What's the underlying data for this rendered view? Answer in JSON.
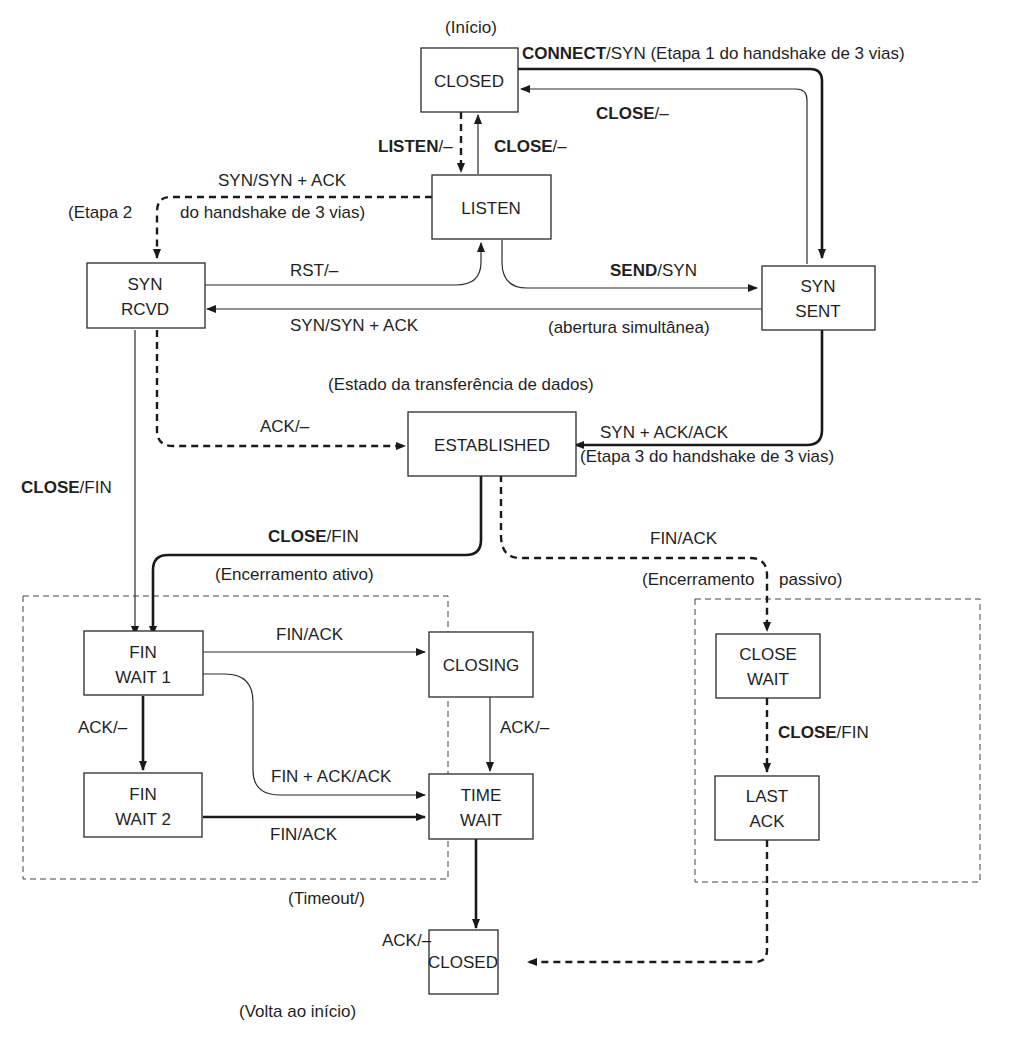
{
  "figure": {
    "states": {
      "closed_top": {
        "lines": [
          "CLOSED"
        ],
        "caption": "(Início)"
      },
      "listen": {
        "lines": [
          "LISTEN"
        ]
      },
      "syn_rcvd": {
        "lines": [
          "SYN",
          "RCVD"
        ]
      },
      "syn_sent": {
        "lines": [
          "SYN",
          "SENT"
        ]
      },
      "established": {
        "lines": [
          "ESTABLISHED"
        ],
        "caption": "(Estado da transferência de dados)"
      },
      "fin_wait_1": {
        "lines": [
          "FIN",
          "WAIT 1"
        ]
      },
      "fin_wait_2": {
        "lines": [
          "FIN",
          "WAIT 2"
        ]
      },
      "closing": {
        "lines": [
          "CLOSING"
        ]
      },
      "time_wait": {
        "lines": [
          "TIME",
          "WAIT"
        ]
      },
      "close_wait": {
        "lines": [
          "CLOSE",
          "WAIT"
        ]
      },
      "last_ack": {
        "lines": [
          "LAST",
          "ACK"
        ]
      },
      "closed_bottom": {
        "lines": [
          "CLOSED"
        ],
        "caption": "(Volta ao início)"
      }
    },
    "transitions": {
      "connect": {
        "bold": "CONNECT",
        "rest": "/SYN (Etapa 1 do handshake de 3 vias)"
      },
      "close_syn_sent": {
        "bold": "CLOSE",
        "rest": "/–"
      },
      "listen_from_closed": {
        "bold": "LISTEN",
        "rest": "/–"
      },
      "close_listen": {
        "bold": "CLOSE",
        "rest": "/–"
      },
      "syn_synack": {
        "text": "SYN/SYN + ACK"
      },
      "etapa2_a": {
        "text": "(Etapa 2"
      },
      "etapa2_b": {
        "text": "do handshake de 3 vias)"
      },
      "rst": {
        "text": "RST/–"
      },
      "send": {
        "bold": "SEND",
        "rest": "/SYN"
      },
      "syn_synack_simul": {
        "text": "SYN/SYN + ACK"
      },
      "simultaneous_open": {
        "text": "(abertura simultânea)"
      },
      "ack_established": {
        "text": "ACK/–"
      },
      "synack_ack": {
        "text": "SYN + ACK/ACK"
      },
      "etapa3": {
        "text": "(Etapa 3 do handshake de 3 vias)"
      },
      "close_fin_left": {
        "bold": "CLOSE",
        "rest": "/FIN"
      },
      "close_fin_est": {
        "bold": "CLOSE",
        "rest": "/FIN"
      },
      "fin_ack_passive": {
        "text": "FIN/ACK"
      },
      "fin_ack_closing": {
        "text": "FIN/ACK"
      },
      "ack_fw2": {
        "text": "ACK/–"
      },
      "ack_closing": {
        "text": "ACK/–"
      },
      "finack_ack": {
        "text": "FIN + ACK/ACK"
      },
      "fin_ack_fw2": {
        "text": "FIN/ACK"
      },
      "close_fin_passive": {
        "bold": "CLOSE",
        "rest": "/FIN"
      },
      "timeout": {
        "text": "(Timeout/)"
      },
      "ack_last": {
        "text": "ACK/–"
      }
    },
    "groups": {
      "active_close": {
        "label": "(Encerramento ativo)"
      },
      "passive_close": {
        "label_a": "(Encerramento",
        "label_b": "passivo)"
      }
    }
  }
}
